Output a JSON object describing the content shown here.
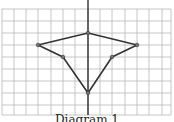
{
  "diagram": {
    "caption": "Diagram 1",
    "grid": {
      "x_lines": [
        2,
        14,
        26,
        38,
        51,
        63,
        75,
        88,
        100,
        112,
        125,
        137,
        149,
        162,
        171
      ],
      "y_lines": [
        9,
        21,
        33,
        45,
        57,
        69,
        81,
        93,
        105,
        115
      ],
      "axis_x": 88,
      "line_color": "#b8b8b8",
      "axis_color": "#222222"
    },
    "shape": {
      "stroke_color": "#333333",
      "vertices": [
        {
          "name": "top",
          "x": 88,
          "y": 33
        },
        {
          "name": "right",
          "x": 137,
          "y": 45
        },
        {
          "name": "inner-right",
          "x": 112,
          "y": 57
        },
        {
          "name": "bottom",
          "x": 88,
          "y": 93
        },
        {
          "name": "inner-left",
          "x": 63,
          "y": 57
        },
        {
          "name": "left",
          "x": 38,
          "y": 45
        }
      ]
    }
  }
}
